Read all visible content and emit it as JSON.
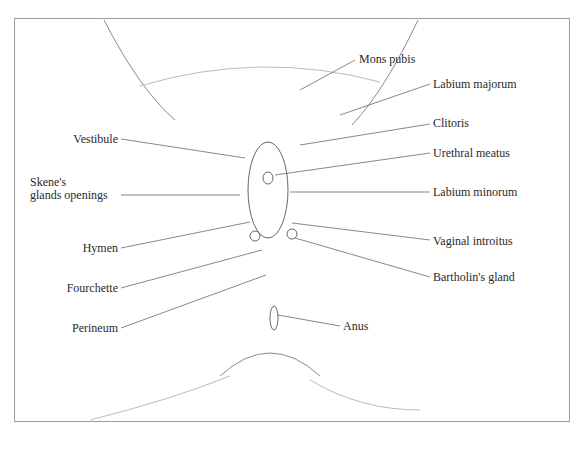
{
  "figure": {
    "type": "anatomical-diagram",
    "labels_left": [
      {
        "id": "vestibule",
        "text": "Vestibule"
      },
      {
        "id": "skenes_1",
        "text": "Skene's"
      },
      {
        "id": "skenes_2",
        "text": "glands openings"
      },
      {
        "id": "hymen",
        "text": "Hymen"
      },
      {
        "id": "fourchette",
        "text": "Fourchette"
      },
      {
        "id": "perineum",
        "text": "Perineum"
      }
    ],
    "labels_right": [
      {
        "id": "mons_pubis",
        "text": "Mons pubis"
      },
      {
        "id": "labium_majorum",
        "text": "Labium majorum"
      },
      {
        "id": "clitoris",
        "text": "Clitoris"
      },
      {
        "id": "urethral_meatus",
        "text": "Urethral meatus"
      },
      {
        "id": "labium_minorum",
        "text": "Labium minorum"
      },
      {
        "id": "vaginal_introitus",
        "text": "Vaginal introitus"
      },
      {
        "id": "bartholins_gland",
        "text": "Bartholin's gland"
      },
      {
        "id": "anus",
        "text": "Anus"
      }
    ]
  }
}
